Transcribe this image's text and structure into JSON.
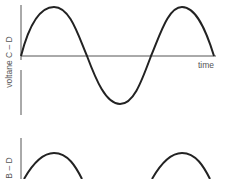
{
  "plots": [
    {
      "ylabel": "voltane C – D",
      "xlabel": "time",
      "waveform": "sine",
      "cycles": 1.5
    },
    {
      "ylabel": "B – D",
      "waveform": "sine (shifted)"
    }
  ],
  "colors": {
    "curve": "#222222",
    "axis": "#555555"
  }
}
